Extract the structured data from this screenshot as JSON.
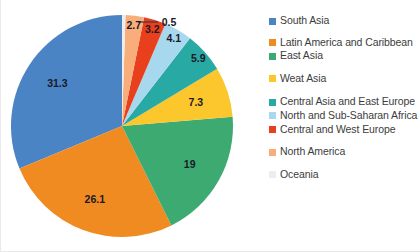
{
  "chart_data": {
    "type": "pie",
    "title": "",
    "subtitle": "",
    "xlabel": "",
    "ylabel": "",
    "grid": false,
    "legend_position": "right",
    "start_angle_deg": 90,
    "direction": "counterclockwise",
    "total": 100.1,
    "categories": [
      "South Asia",
      "Latin America and Caribbean",
      "East Asia",
      "Weat Asia",
      "Central Asia and East Europe",
      "North and Sub-Saharan Africa",
      "Central and West Europe",
      "North America",
      "Oceania"
    ],
    "values": [
      31.3,
      26.1,
      19,
      7.3,
      5.9,
      4.1,
      3.2,
      2.7,
      0.5
    ],
    "colors": [
      "#4A84C4",
      "#F08B22",
      "#3DAA72",
      "#FCC72C",
      "#29A9A3",
      "#A8D8EE",
      "#E8401C",
      "#F9AD7B",
      "#EDEDED"
    ],
    "data_labels": [
      "31.3",
      "26.1",
      "19",
      "7.3",
      "5.9",
      "4.1",
      "3.2",
      "2.7",
      "0.5"
    ],
    "annotations": [
      {
        "text": "0.5",
        "note": "leader line from thin Oceania slice to label above pie"
      }
    ]
  },
  "legend": {
    "items": [
      {
        "label": "South Asia",
        "color": "#4A84C4"
      },
      {
        "label": "Latin America and Caribbean",
        "color": "#F08B22"
      },
      {
        "label": "East Asia",
        "color": "#3DAA72"
      },
      {
        "label": "Weat Asia",
        "color": "#FCC72C"
      },
      {
        "label": "Central Asia and East Europe",
        "color": "#29A9A3"
      },
      {
        "label": "North and Sub-Saharan Africa",
        "color": "#A8D8EE"
      },
      {
        "label": "Central and West Europe",
        "color": "#E8401C"
      },
      {
        "label": "North America",
        "color": "#F9AD7B"
      },
      {
        "label": "Oceania",
        "color": "#EDEDED"
      }
    ]
  }
}
